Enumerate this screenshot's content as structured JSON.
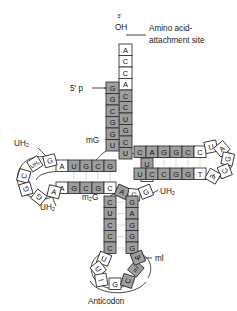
{
  "figure": {
    "annotations": {
      "three_prime": "3'",
      "oh": "OH",
      "five_prime_p": "5' p",
      "amino_acid_site_line1": "Amino acid-",
      "amino_acid_site_line2": "attachment site",
      "anticodon": "Anticodon",
      "mg": "mG",
      "m2g": "m₂G",
      "uh2_dloop_top": "UH₂",
      "uh2_dloop_bottom": "UH₂",
      "uh2_variable": "UH₂",
      "ml": "ml"
    },
    "colors": {
      "shaded_fill": "#9e9e9e",
      "open_fill": "#ffffff",
      "stroke": "#2b2b2b",
      "hbond": "#9a9a9a",
      "text": "#111111"
    },
    "acceptor_stem": {
      "three_prime_tail": [
        "A",
        "C",
        "C",
        "A"
      ],
      "three_prime_strand": [
        "C",
        "C",
        "U",
        "G",
        "C",
        "U"
      ],
      "five_prime_strand": [
        "G",
        "G",
        "C",
        "G",
        "G",
        "U"
      ]
    },
    "d_arm": {
      "stem_top": [
        "A",
        "U",
        "G",
        "C",
        "G"
      ],
      "stem_bottom": [
        "A",
        "G",
        "C",
        "G",
        "C"
      ],
      "loop": [
        "UH₂",
        "G",
        "A",
        "C",
        "G",
        "G",
        "A",
        "UH₂"
      ]
    },
    "t_arm": {
      "stem_top": [
        "C",
        "A",
        "G",
        "G",
        "C",
        "C"
      ],
      "stem_bottom": [
        "U",
        "C",
        "C",
        "G",
        "G",
        "T"
      ],
      "loop": [
        "U",
        "U",
        "A",
        "G",
        "C",
        "Ψ",
        "T"
      ]
    },
    "variable_loop": [
      "A",
      "G",
      "G",
      "C",
      "U"
    ],
    "anticodon_arm": {
      "stem_left": [
        "C",
        "U",
        "C",
        "C",
        "C"
      ],
      "stem_right": [
        "G",
        "A",
        "G",
        "G",
        "G"
      ],
      "loop": [
        "U",
        "U",
        "I",
        "G",
        "C",
        "mI",
        "Ψ"
      ],
      "anticodon_triplet": [
        "I",
        "G",
        "C"
      ]
    }
  }
}
